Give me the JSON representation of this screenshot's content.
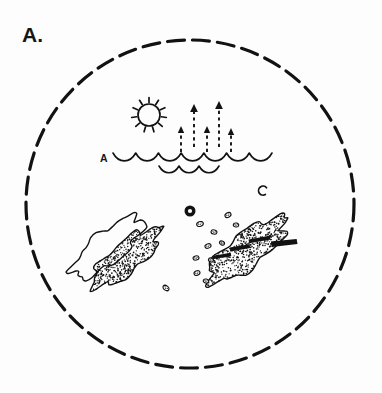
{
  "figure": {
    "panel_label": "A.",
    "background_color": "#fdfdfd",
    "ink_color": "#121212",
    "boundary": {
      "name": "dashed-circle-boundary",
      "center_x": 190,
      "center_y": 204,
      "radius": 164,
      "style": "dashed",
      "dash_length": 17,
      "gap_length": 8,
      "stroke_width": 3.2
    },
    "labels": [
      {
        "id": "panel",
        "text": "A.",
        "x": 22,
        "y": 42
      },
      {
        "id": "region-a",
        "text": "A",
        "x": 100,
        "y": 162
      }
    ],
    "center_marker": {
      "name": "center-ring-marker",
      "x": 190,
      "y": 211,
      "outer_radius": 5.2,
      "inner_radius": 2.4
    },
    "sun": {
      "name": "sun-symbol",
      "x": 149,
      "y": 115,
      "radius": 11,
      "ray_count": 11,
      "ray_length": 5
    },
    "arrows": {
      "name": "evaporation-arrows",
      "style": "dashed-upward",
      "items": [
        {
          "x": 181,
          "base_y": 152,
          "tip_y": 126,
          "size": "short"
        },
        {
          "x": 194,
          "base_y": 147,
          "tip_y": 104,
          "size": "tall"
        },
        {
          "x": 207,
          "base_y": 152,
          "tip_y": 126,
          "size": "short"
        },
        {
          "x": 219,
          "base_y": 147,
          "tip_y": 101,
          "size": "tall"
        },
        {
          "x": 231,
          "base_y": 152,
          "tip_y": 128,
          "size": "short"
        }
      ]
    },
    "waves": {
      "name": "ocean-surface-waves",
      "primary": {
        "y": 153,
        "x_start": 113,
        "x_end": 272,
        "crest_count": 7,
        "amplitude": 7
      },
      "secondary": {
        "y": 166,
        "x_start": 159,
        "x_end": 219,
        "crest_count": 3,
        "amplitude": 6
      }
    },
    "clouds": [
      {
        "name": "left-cloud-mass",
        "id": "cloud-left",
        "center_x": 117,
        "center_y": 253,
        "rotation_deg": -40,
        "stippled": true,
        "has_outer_lobe": true,
        "has_lightning": false
      },
      {
        "name": "right-cloud-mass",
        "id": "cloud-right",
        "center_x": 247,
        "center_y": 250,
        "rotation_deg": -38,
        "stippled": true,
        "has_outer_lobe": false,
        "has_lightning": true
      }
    ],
    "lightning": {
      "name": "lightning-bolt",
      "start_x": 212,
      "start_y": 256,
      "end_x": 297,
      "end_y": 241
    },
    "debris": {
      "name": "debris-fragments",
      "count": 11,
      "items": [
        {
          "x": 200,
          "y": 224,
          "rx": 3.4,
          "ry": 2.4,
          "rot": -22
        },
        {
          "x": 214,
          "y": 232,
          "rx": 3.0,
          "ry": 2.1,
          "rot": 14
        },
        {
          "x": 228,
          "y": 215,
          "rx": 3.2,
          "ry": 2.2,
          "rot": -30
        },
        {
          "x": 236,
          "y": 225,
          "rx": 2.7,
          "ry": 2.0,
          "rot": 8
        },
        {
          "x": 208,
          "y": 246,
          "rx": 3.1,
          "ry": 2.2,
          "rot": -18
        },
        {
          "x": 222,
          "y": 243,
          "rx": 2.6,
          "ry": 1.9,
          "rot": 26
        },
        {
          "x": 196,
          "y": 258,
          "rx": 3.0,
          "ry": 2.1,
          "rot": -12
        },
        {
          "x": 211,
          "y": 260,
          "rx": 2.6,
          "ry": 1.9,
          "rot": 20
        },
        {
          "x": 197,
          "y": 273,
          "rx": 3.1,
          "ry": 2.2,
          "rot": -26
        },
        {
          "x": 206,
          "y": 281,
          "rx": 2.8,
          "ry": 2.0,
          "rot": 10
        },
        {
          "x": 166,
          "y": 288,
          "rx": 3.3,
          "ry": 2.3,
          "rot": 34
        }
      ]
    },
    "hook_mark": {
      "name": "hook-crescent-mark",
      "x": 262,
      "y": 190,
      "radius": 4.5
    }
  }
}
